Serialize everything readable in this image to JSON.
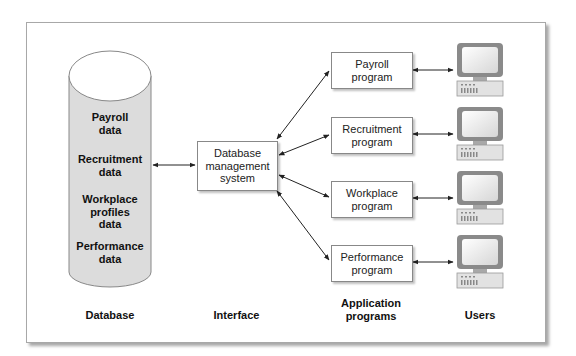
{
  "database": {
    "items": [
      {
        "label": "Payroll\ndata"
      },
      {
        "label": "Recruitment\ndata"
      },
      {
        "label": "Workplace\nprofiles\ndata"
      },
      {
        "label": "Performance\ndata"
      }
    ],
    "column_label": "Database"
  },
  "interface": {
    "box_label": "Database\nmanagement\nsystem",
    "column_label": "Interface"
  },
  "programs": {
    "items": [
      {
        "label": "Payroll\nprogram"
      },
      {
        "label": "Recruitment\nprogram"
      },
      {
        "label": "Workplace\nprogram"
      },
      {
        "label": "Performance\nprogram"
      }
    ],
    "column_label": "Application\nprograms"
  },
  "users": {
    "count": 4,
    "column_label": "Users"
  },
  "colors": {
    "cylinder_fill": "#dcdcdc",
    "monitor_frame": "#8a8a8a",
    "arrow": "#222222"
  }
}
